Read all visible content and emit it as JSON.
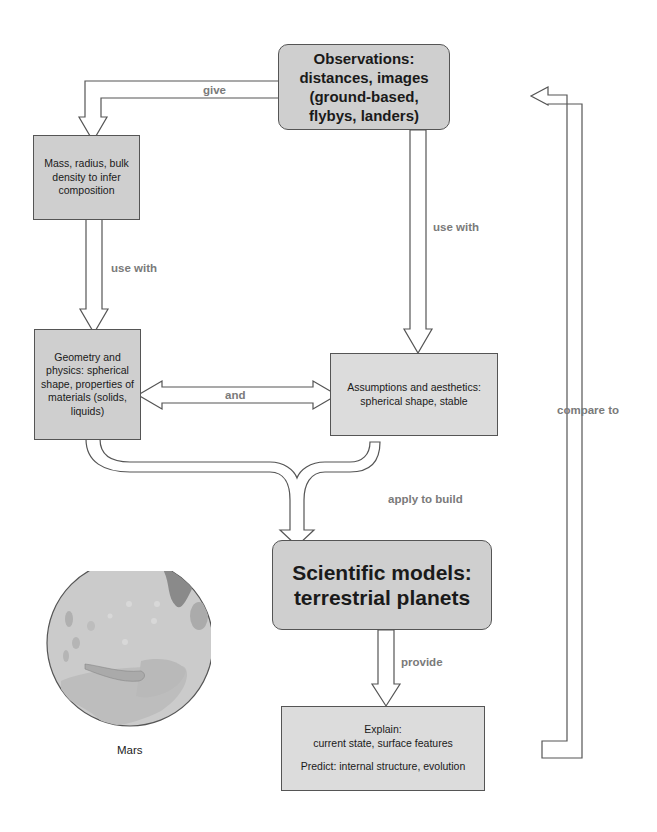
{
  "diagram": {
    "nodes": {
      "observations": "Observations: distances, images (ground-based, flybys, landers)",
      "mass": "Mass, radius, bulk density to infer composition",
      "geometry": "Geometry and physics: spherical shape, properties of materials (solids, liquids)",
      "assumptions": "Assumptions and aesthetics: spherical shape, stable",
      "models": "Scientific models: terrestrial planets",
      "explain_line1": "Explain:",
      "explain_line2": "current state, surface features",
      "predict": "Predict: internal structure, evolution"
    },
    "edges": {
      "give": "give",
      "use_with_left": "use with",
      "use_with_right": "use with",
      "and": "and",
      "apply_to_build": "apply to build",
      "provide": "provide",
      "compare_to": "compare to"
    },
    "illustration": {
      "caption": "Mars"
    },
    "colors": {
      "box_fill": "#cfcfcf",
      "box_fill_light": "#dcdcdc",
      "stroke": "#555555",
      "edge_label": "#7a7a7a",
      "mars_base": "#c8c8c8",
      "mars_dark": "#8a8a8a"
    }
  }
}
